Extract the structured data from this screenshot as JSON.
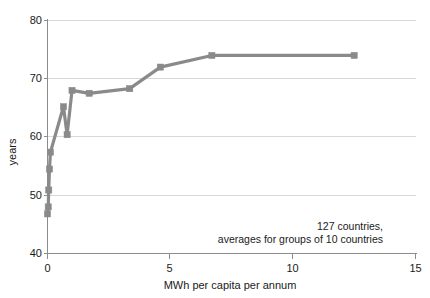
{
  "chart_data": {
    "type": "line",
    "title": "",
    "xlabel": "MWh per capita per annum",
    "ylabel": "years",
    "xlim": [
      0,
      15
    ],
    "ylim": [
      40,
      80
    ],
    "xticks": [
      0,
      5,
      10,
      15
    ],
    "xtick_labels": [
      "0",
      "5",
      "10",
      "15"
    ],
    "yticks": [
      40,
      50,
      60,
      70,
      80
    ],
    "ytick_labels": [
      "40",
      "50",
      "60",
      "70",
      "80"
    ],
    "grid": "horizontal-light",
    "legend": "none",
    "marker": "square",
    "series": [
      {
        "name": "life expectancy vs energy use",
        "x": [
          0.0,
          0.03,
          0.05,
          0.08,
          0.12,
          0.65,
          0.8,
          1.0,
          1.7,
          3.35,
          4.6,
          6.7,
          12.5
        ],
        "y": [
          46.8,
          48.0,
          50.9,
          54.5,
          57.4,
          65.2,
          60.4,
          68.0,
          67.5,
          68.3,
          72.0,
          74.0,
          74.0
        ]
      }
    ],
    "annotations": [
      {
        "text": "127 countries,",
        "x": 9.6,
        "y": 45.6
      },
      {
        "text": "averages for groups of 10 countries",
        "x": 9.6,
        "y": 44.0
      }
    ]
  },
  "axes": {
    "y_axis_title": "years",
    "x_axis_title": "MWh per capita per annum"
  },
  "annotation": {
    "line1": "127 countries,",
    "line2": "averages for groups of 10 countries"
  },
  "colors": {
    "series": "#8a8a8a",
    "axis": "#8c8c8c",
    "grid": "#d8d8d8",
    "text": "#1a1a1a",
    "background": "#ffffff"
  },
  "tick_values": {
    "x": [
      "0",
      "5",
      "10",
      "15"
    ],
    "y": [
      "40",
      "50",
      "60",
      "70",
      "80"
    ]
  }
}
